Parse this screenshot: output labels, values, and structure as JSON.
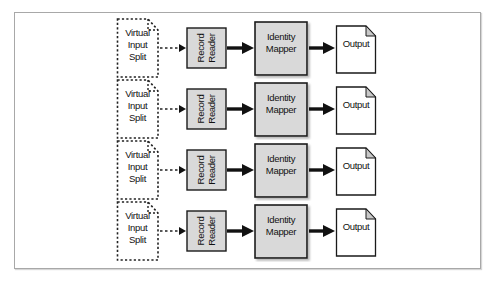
{
  "diagram": {
    "type": "flow",
    "rows": [
      {
        "split": "Virtual\nInput\nSplit",
        "reader": "Record\nReader",
        "mapper": "Identity\nMapper",
        "output": "Output"
      },
      {
        "split": "Virtual\nInput\nSplit",
        "reader": "Record\nReader",
        "mapper": "Identity\nMapper",
        "output": "Output"
      },
      {
        "split": "Virtual\nInput\nSplit",
        "reader": "Record\nReader",
        "mapper": "Identity\nMapper",
        "output": "Output"
      },
      {
        "split": "Virtual\nInput\nSplit",
        "reader": "Record\nReader",
        "mapper": "Identity\nMapper",
        "output": "Output"
      }
    ],
    "edges": [
      {
        "from": "Virtual Input Split",
        "to": "Record Reader",
        "style": "dashed"
      },
      {
        "from": "Record Reader",
        "to": "Identity Mapper",
        "style": "thick-solid"
      },
      {
        "from": "Identity Mapper",
        "to": "Output",
        "style": "thick-solid"
      }
    ],
    "colors": {
      "box_fill": "#d9d9d9",
      "box_stroke": "#1a1a1a",
      "document_fill": "#ffffff",
      "fold_fill": "#c8c8c8",
      "frame_border": "#a8a8a8"
    }
  }
}
